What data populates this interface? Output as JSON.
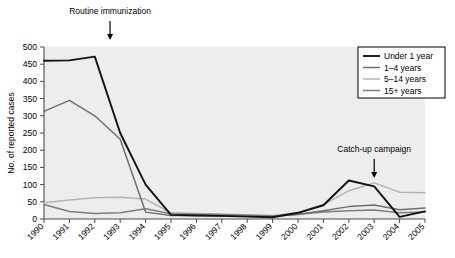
{
  "chart_data": {
    "type": "line",
    "title": "",
    "xlabel": "",
    "ylabel": "No. of reported cases",
    "x": [
      1990,
      1991,
      1992,
      1993,
      1994,
      1995,
      1996,
      1997,
      1998,
      1999,
      2000,
      2001,
      2002,
      2003,
      2004,
      2005
    ],
    "categories": [
      "1990",
      "1991",
      "1992",
      "1993",
      "1994",
      "1995",
      "1996",
      "1997",
      "1998",
      "1999",
      "2000",
      "2001",
      "2002",
      "2003",
      "2004",
      "2005"
    ],
    "xlim": [
      1990,
      2005
    ],
    "ylim": [
      0,
      500
    ],
    "yticks": [
      0,
      50,
      100,
      150,
      200,
      250,
      300,
      350,
      400,
      450,
      500
    ],
    "grid": false,
    "legend_position": "top-right",
    "series": [
      {
        "name": "Under 1 year",
        "color": "#111111",
        "values": [
          460,
          461,
          472,
          250,
          100,
          12,
          10,
          9,
          7,
          5,
          18,
          40,
          112,
          95,
          6,
          22
        ]
      },
      {
        "name": "1–4 years",
        "color": "#6f6f6f",
        "values": [
          313,
          345,
          300,
          232,
          20,
          10,
          10,
          9,
          8,
          7,
          14,
          24,
          36,
          41,
          27,
          32
        ]
      },
      {
        "name": "5–14 years",
        "color": "#b4b4b4",
        "values": [
          47,
          55,
          62,
          63,
          58,
          18,
          16,
          14,
          12,
          10,
          18,
          42,
          82,
          105,
          78,
          76
        ]
      },
      {
        "name": "15+ years",
        "color": "#7e7e7e",
        "values": [
          42,
          22,
          16,
          18,
          30,
          15,
          14,
          13,
          11,
          9,
          13,
          20,
          24,
          26,
          18,
          20
        ]
      }
    ],
    "annotations": [
      {
        "text": "Routine immunization",
        "x": 1992.6,
        "arrow": "down",
        "label_y": 14
      },
      {
        "text": "Catch-up campaign",
        "x": 2003.0,
        "arrow": "down",
        "label_y": 152
      }
    ]
  },
  "legend": {
    "items": [
      "Under 1 year",
      "1–4 years",
      "5–14 years",
      "15+ years"
    ]
  }
}
